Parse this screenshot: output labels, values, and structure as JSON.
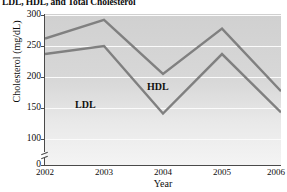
{
  "chart_data": {
    "type": "line",
    "title": "LDL, HDL, and Total Cholesterol",
    "xlabel": "Year",
    "ylabel": "Cholesterol (mg/dL)",
    "x": [
      2002,
      2003,
      2004,
      2005,
      2006
    ],
    "xtick_labels": [
      "2002",
      "2003",
      "2004",
      "2005",
      "2006"
    ],
    "ytick_labels": [
      "300",
      "250",
      "200",
      "150",
      "100",
      "0"
    ],
    "ytick_values": [
      300,
      250,
      200,
      150,
      100,
      0
    ],
    "ylim": [
      100,
      300
    ],
    "xlim": [
      2002,
      2006
    ],
    "grid": "horizontal",
    "y_axis_break": true,
    "legend_position": "inline-annotations",
    "series": [
      {
        "name": "Total Cholesterol",
        "values": [
          262,
          292,
          205,
          278,
          177
        ],
        "color": "#808080"
      },
      {
        "name": "LDL",
        "values": [
          237,
          250,
          141,
          237,
          143
        ],
        "color": "#808080"
      }
    ],
    "annotations": [
      {
        "text": "LDL",
        "x": 2002.7,
        "y": 175
      },
      {
        "text": "HDL",
        "x": 2003.9,
        "y": 198
      }
    ]
  }
}
